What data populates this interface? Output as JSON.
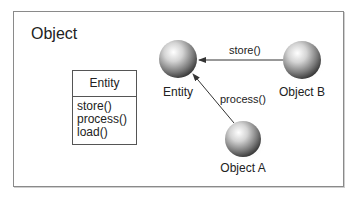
{
  "diagram": {
    "title": "Object",
    "class_box": {
      "name": "Entity",
      "operations": [
        "store()",
        "process()",
        "load()"
      ]
    },
    "nodes": [
      {
        "id": "entity",
        "label": "Entity"
      },
      {
        "id": "object_b",
        "label": "Object B"
      },
      {
        "id": "object_a",
        "label": "Object A"
      }
    ],
    "edges": [
      {
        "from": "object_b",
        "to": "entity",
        "label": "store()"
      },
      {
        "from": "object_a",
        "to": "entity",
        "label": "process()"
      }
    ]
  }
}
